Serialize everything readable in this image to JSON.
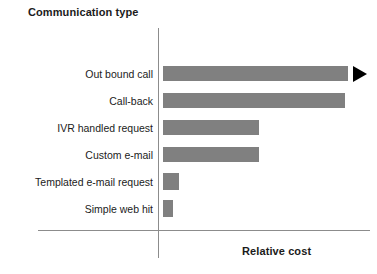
{
  "chart_data": {
    "type": "bar",
    "orientation": "horizontal",
    "title": "",
    "ylabel": "Communication type",
    "xlabel": "Relative cost",
    "grid": false,
    "legend": false,
    "axis_ticks": false,
    "bar_color": "#808080",
    "axis_color": "#8c8c8c",
    "text_color": "#1b1b1b",
    "arrow_color": "#000000",
    "xlim": [
      0,
      200
    ],
    "categories": [
      "Out bound call",
      "Call-back",
      "IVR handled request",
      "Custom e-mail",
      "Templated e-mail request",
      "Simple web hit"
    ],
    "values": [
      185,
      182,
      96,
      96,
      16,
      10
    ],
    "annotations": [
      {
        "name": "overflow-arrow",
        "icon": "triangle-right-icon",
        "attached_to": "Out bound call",
        "meaning": "bar continues beyond axis"
      }
    ]
  },
  "chart": {
    "y_axis_title": "Communication type",
    "x_axis_title": "Relative cost",
    "rows": [
      {
        "label": "Out bound call",
        "value": 185,
        "has_arrow": true
      },
      {
        "label": "Call-back",
        "value": 182,
        "has_arrow": false
      },
      {
        "label": "IVR handled request",
        "value": 96,
        "has_arrow": false
      },
      {
        "label": "Custom e-mail",
        "value": 96,
        "has_arrow": false
      },
      {
        "label": "Templated e-mail request",
        "value": 16,
        "has_arrow": false
      },
      {
        "label": "Simple web hit",
        "value": 10,
        "has_arrow": false
      }
    ]
  }
}
